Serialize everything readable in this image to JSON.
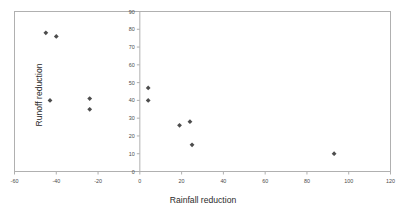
{
  "chart_data": {
    "type": "scatter",
    "title": "",
    "xlabel": "Rainfall reduction",
    "ylabel": "Runoff reduction",
    "xlim": [
      -60,
      120
    ],
    "ylim": [
      0,
      90
    ],
    "xticks": [
      -60,
      -40,
      -20,
      0,
      20,
      40,
      60,
      80,
      100,
      120
    ],
    "yticks": [
      0,
      10,
      20,
      30,
      40,
      50,
      60,
      70,
      80,
      90
    ],
    "xticklabels": [
      "-60",
      "-40",
      "-20",
      "0",
      "20",
      "40",
      "60",
      "80",
      "100",
      "120"
    ],
    "yticklabels": [
      "0",
      "10",
      "20",
      "30",
      "40",
      "50",
      "60",
      "70",
      "80",
      "90"
    ],
    "grid": false,
    "legend": null,
    "marker": "diamond",
    "marker_color": "#4d4d4d",
    "series": [
      {
        "name": "Rainfall vs runoff reduction",
        "points": [
          {
            "x": -45,
            "y": 78
          },
          {
            "x": -40,
            "y": 76
          },
          {
            "x": -43,
            "y": 40
          },
          {
            "x": -24,
            "y": 41
          },
          {
            "x": -24,
            "y": 35
          },
          {
            "x": 4,
            "y": 47
          },
          {
            "x": 4,
            "y": 40
          },
          {
            "x": 19,
            "y": 26
          },
          {
            "x": 24,
            "y": 28
          },
          {
            "x": 25,
            "y": 15
          },
          {
            "x": 93,
            "y": 10
          }
        ]
      }
    ]
  }
}
